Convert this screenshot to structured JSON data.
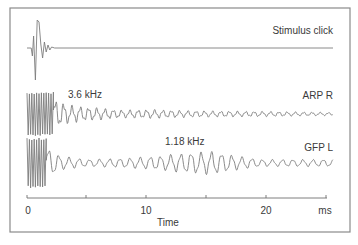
{
  "chart_data": {
    "type": "line",
    "title": "",
    "xlabel": "Time",
    "xunit": "ms",
    "ylabel": "",
    "xlim": [
      0,
      25
    ],
    "x_ticks": [
      0,
      5,
      10,
      15,
      20,
      25
    ],
    "x_tick_labels": [
      "0",
      "",
      "10",
      "",
      "20",
      "ms"
    ],
    "grid": false,
    "legend": "none",
    "series": [
      {
        "name": "Stimulus click",
        "description": "Brief click transient near t=0-2.5 ms then flat baseline",
        "baseline_px": 48,
        "events": [
          {
            "t": 0.0,
            "y": 0
          },
          {
            "t": 0.35,
            "y": 0
          },
          {
            "t": 0.45,
            "y": -8
          },
          {
            "t": 0.55,
            "y": 12
          },
          {
            "t": 0.7,
            "y": -32
          },
          {
            "t": 0.85,
            "y": 28
          },
          {
            "t": 1.0,
            "y": 26
          },
          {
            "t": 1.15,
            "y": 4
          },
          {
            "t": 1.3,
            "y": -10
          },
          {
            "t": 1.45,
            "y": 6
          },
          {
            "t": 1.6,
            "y": -4
          },
          {
            "t": 1.75,
            "y": 3
          },
          {
            "t": 1.9,
            "y": -2
          },
          {
            "t": 2.05,
            "y": 1
          },
          {
            "t": 2.3,
            "y": 0
          },
          {
            "t": 25.5,
            "y": 0
          }
        ],
        "end_t": 25.5
      },
      {
        "name": "ARP R",
        "annotation": "3.6 kHz",
        "dominant_frequency_khz": 3.6,
        "baseline_px": 114,
        "artifact_end_ms": 2.2,
        "artifact_amplitude_px": 22,
        "decay": [
          {
            "t": 2.2,
            "amp": 12
          },
          {
            "t": 3.5,
            "amp": 7
          },
          {
            "t": 5.5,
            "amp": 5
          },
          {
            "t": 8.0,
            "amp": 3
          },
          {
            "t": 10.0,
            "amp": 3.5
          },
          {
            "t": 14.0,
            "amp": 2.5
          },
          {
            "t": 20.0,
            "amp": 2
          },
          {
            "t": 25.5,
            "amp": 1.2
          }
        ],
        "end_t": 25.5
      },
      {
        "name": "GFP L",
        "annotation": "1.18 kHz",
        "dominant_frequency_khz": 1.18,
        "baseline_px": 163,
        "artifact_end_ms": 1.6,
        "artifact_amplitude_px": 25,
        "decay": [
          {
            "t": 1.6,
            "amp": 14
          },
          {
            "t": 2.8,
            "amp": 6
          },
          {
            "t": 5.0,
            "amp": 3
          },
          {
            "t": 8.0,
            "amp": 4
          },
          {
            "t": 11.0,
            "amp": 6
          },
          {
            "t": 13.5,
            "amp": 9
          },
          {
            "t": 15.5,
            "amp": 10
          },
          {
            "t": 17.5,
            "amp": 6
          },
          {
            "t": 19.5,
            "amp": 3
          },
          {
            "t": 25.5,
            "amp": 3
          }
        ],
        "end_t": 25.5
      }
    ],
    "annotations": [
      {
        "text": "3.6 kHz",
        "series": "ARP R"
      },
      {
        "text": "1.18 kHz",
        "series": "GFP L"
      }
    ]
  },
  "labels": {
    "stimulus": "Stimulus click",
    "arp": "ARP R",
    "gfp": "GFP L",
    "arp_freq": "3.6 kHz",
    "gfp_freq": "1.18 kHz",
    "xlabel": "Time",
    "unit": "ms",
    "tick_0": "0",
    "tick_10": "10",
    "tick_20": "20"
  }
}
